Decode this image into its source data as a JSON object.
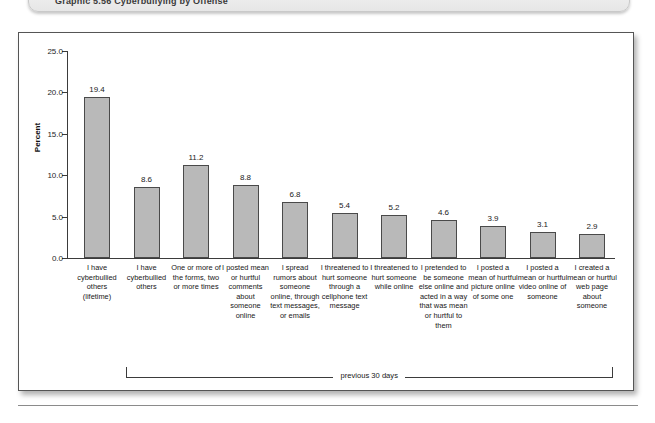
{
  "caption": {
    "text": "Graphic 5.56 Cyberbullying by Offense"
  },
  "chart_data": {
    "type": "bar",
    "title": "",
    "xlabel": "",
    "ylabel": "Percent",
    "ylim": [
      0.0,
      25.0
    ],
    "yticks": [
      "0.0",
      "5.0",
      "10.0",
      "15.0",
      "20.0",
      "25.0"
    ],
    "ytick_values": [
      0.0,
      5.0,
      10.0,
      15.0,
      20.0,
      25.0
    ],
    "grid": false,
    "legend": "none",
    "bar_color": "#b9b9b9",
    "bar_border_color": "#4a4a4a",
    "axis_color": "#3b3b3b",
    "categories": [
      "I have cyberbullied others (lifetime)",
      "I have cyberbullied others",
      "One or more of the forms, two or more times",
      "I posted mean or hurtful comments about someone online",
      "I spread rumors about someone online, through text messages, or emails",
      "I threatened to hurt someone through a cellphone text message",
      "I threatened to hurt someone while online",
      "I pretended to be someone else online and acted in a way that was mean or hurtful to them",
      "I posted a mean of hurtful picture online of some one",
      "I posted a mean or hurtful video online of someone",
      "I created a mean or hurtful web page about someone"
    ],
    "values": [
      19.4,
      8.6,
      11.2,
      8.8,
      6.8,
      5.4,
      5.2,
      4.6,
      3.9,
      3.1,
      2.9
    ],
    "value_labels": [
      "19.4",
      "8.6",
      "11.2",
      "8.8",
      "6.8",
      "5.4",
      "5.2",
      "4.6",
      "3.9",
      "3.1",
      "2.9"
    ],
    "annotations": [
      {
        "text": "previous 30 days",
        "spans_categories": [
          1,
          10
        ]
      }
    ]
  }
}
